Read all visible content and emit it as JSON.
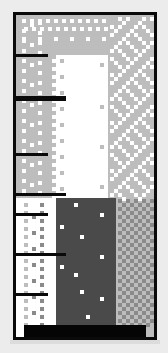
{
  "game": {
    "scene": "vertical-well-level",
    "colors": {
      "background": "#ececec",
      "frame": "#0a0a0a",
      "light_gray": "#bdbdbd",
      "white": "#ffffff",
      "dark_gray": "#4a4a4a",
      "mid_gray": "#8a8a8a",
      "floor": "#050505"
    },
    "regions": [
      {
        "name": "upper-left-gray",
        "x": 0,
        "y": 0,
        "w": 36,
        "h": 183,
        "color": "#bdbdbd"
      },
      {
        "name": "upper-center-white",
        "x": 36,
        "y": 40,
        "w": 56,
        "h": 143,
        "color": "#ffffff"
      },
      {
        "name": "upper-right-gray",
        "x": 92,
        "y": 0,
        "w": 46,
        "h": 183,
        "color": "#bdbdbd"
      },
      {
        "name": "lower-left-white",
        "x": 0,
        "y": 183,
        "w": 40,
        "h": 139,
        "color": "#ffffff"
      },
      {
        "name": "lower-center-dark",
        "x": 40,
        "y": 183,
        "w": 60,
        "h": 139,
        "color": "#4a4a4a"
      },
      {
        "name": "lower-right-gray",
        "x": 100,
        "y": 183,
        "w": 38,
        "h": 139,
        "color": "#bdbdbd"
      }
    ],
    "ledges": [
      {
        "y": 39,
        "width": 32,
        "thickness": 3
      },
      {
        "y": 81,
        "width": 50,
        "thickness": 5
      },
      {
        "y": 138,
        "width": 32,
        "thickness": 3
      },
      {
        "y": 178,
        "width": 50,
        "thickness": 3
      },
      {
        "y": 198,
        "width": 32,
        "thickness": 3
      },
      {
        "y": 238,
        "width": 50,
        "thickness": 3
      },
      {
        "y": 278,
        "width": 32,
        "thickness": 3
      }
    ],
    "floor": {
      "x": 8,
      "y": 310,
      "w": 122,
      "h": 12
    },
    "sparkles": [
      {
        "x": 58,
        "y": 188
      },
      {
        "x": 84,
        "y": 198
      },
      {
        "x": 64,
        "y": 220
      },
      {
        "x": 84,
        "y": 240
      },
      {
        "x": 58,
        "y": 258
      },
      {
        "x": 64,
        "y": 275
      },
      {
        "x": 84,
        "y": 282
      },
      {
        "x": 70,
        "y": 300
      },
      {
        "x": 44,
        "y": 210
      },
      {
        "x": 44,
        "y": 250
      },
      {
        "x": 84,
        "y": 48
      },
      {
        "x": 84,
        "y": 90
      },
      {
        "x": 84,
        "y": 130
      },
      {
        "x": 84,
        "y": 170
      }
    ]
  }
}
